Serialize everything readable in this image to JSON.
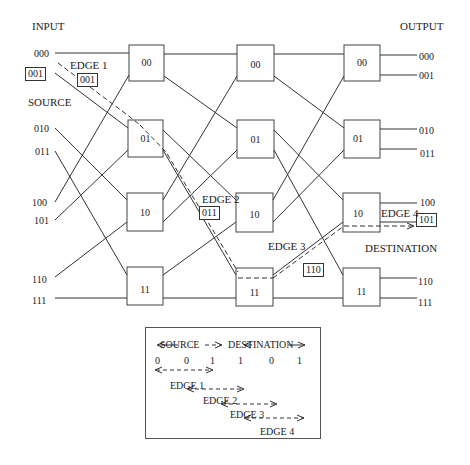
{
  "labels": {
    "input": "INPUT",
    "output": "OUTPUT",
    "source": "SOURCE",
    "destination": "DESTINATION"
  },
  "inputs": [
    "000",
    "001",
    "010",
    "011",
    "100",
    "101",
    "110",
    "111"
  ],
  "outputs": [
    "000",
    "001",
    "010",
    "011",
    "100",
    "101",
    "110",
    "111"
  ],
  "stages": [
    {
      "name": "stage-1",
      "switches": [
        "00",
        "01",
        "10",
        "11"
      ]
    },
    {
      "name": "stage-2",
      "switches": [
        "00",
        "01",
        "10",
        "11"
      ]
    },
    {
      "name": "stage-3",
      "switches": [
        "00",
        "01",
        "10",
        "11"
      ]
    }
  ],
  "highlighted": {
    "source_input": "001",
    "destination_output": "101"
  },
  "edges": [
    {
      "label": "EDGE 1",
      "tag": "001"
    },
    {
      "label": "EDGE 2",
      "tag": "011"
    },
    {
      "label": "EDGE 3",
      "tag": "110"
    },
    {
      "label": "EDGE 4",
      "tag": "101"
    }
  ],
  "legend": {
    "source_label": "SOURCE",
    "destination_label": "DESTINATION",
    "bits": [
      "0",
      "0",
      "1",
      "1",
      "0",
      "1"
    ],
    "edge_labels": [
      "EDGE 1",
      "EDGE 2",
      "EDGE 3",
      "EDGE 4"
    ]
  },
  "colors": {
    "line": "#333333",
    "background": "#ffffff"
  }
}
